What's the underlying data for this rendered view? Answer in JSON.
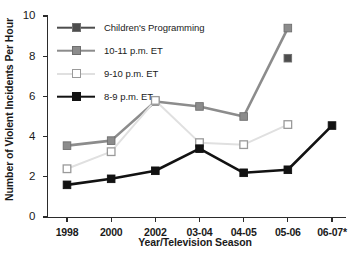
{
  "chart_data": {
    "type": "line",
    "title": "",
    "xlabel": "Year/Television Season",
    "ylabel": "Number of Violent Incidents Per Hour",
    "categories": [
      "1998",
      "2000",
      "2002",
      "03-04",
      "04-05",
      "05-06",
      "06-07*"
    ],
    "ylim": [
      0,
      10
    ],
    "yticks": [
      0,
      2,
      4,
      6,
      8,
      10
    ],
    "ytick_labels": [
      "0",
      "2",
      "4",
      "6",
      "8",
      "10"
    ],
    "grid": false,
    "legend_position": "upper-left-inside",
    "series": [
      {
        "name": "Children's Programming",
        "color": "#4d4d4d",
        "marker": "filled-square",
        "values": [
          null,
          null,
          null,
          null,
          null,
          7.9,
          null
        ]
      },
      {
        "name": "10-11 p.m. ET",
        "color": "#8c8c8c",
        "marker": "filled-square",
        "values": [
          3.55,
          3.8,
          5.75,
          5.5,
          5.0,
          9.4,
          null
        ]
      },
      {
        "name": "9-10 p.m. ET",
        "color": "#e0e0e0",
        "marker": "open-square",
        "values": [
          2.4,
          3.25,
          5.8,
          3.7,
          3.6,
          4.6,
          null
        ]
      },
      {
        "name": "8-9 p.m. ET",
        "color": "#121212",
        "marker": "filled-square",
        "values": [
          1.6,
          1.9,
          2.3,
          3.4,
          2.2,
          2.35,
          4.55
        ]
      }
    ]
  },
  "legend": {
    "items": [
      {
        "label": "Children's Programming"
      },
      {
        "label": "10-11 p.m. ET"
      },
      {
        "label": "9-10 p.m. ET"
      },
      {
        "label": "8-9 p.m. ET"
      }
    ]
  }
}
